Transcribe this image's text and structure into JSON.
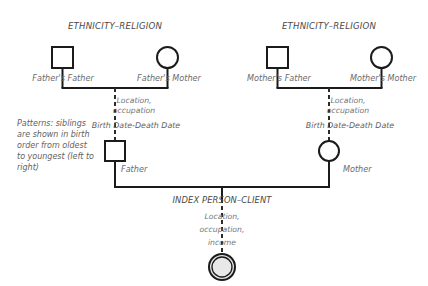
{
  "diagram": {
    "type": "genogram",
    "title_left": "ETHNICITY–RELIGION",
    "title_right": "ETHNICITY–RELIGION",
    "colors": {
      "line": "#1b1b1b",
      "text": "#6b6b6b",
      "heading_text": "#4a4a4a",
      "index_fill": "#e3e3e3",
      "background": "#ffffff"
    }
  },
  "paternal": {
    "heading": "ETHNICITY–RELIGION",
    "father_father_label": "Father's Father",
    "father_mother_label": "Father's Mother",
    "union_detail_line1": "Location,",
    "union_detail_line2": "occupation",
    "union_dates": "Birth Date-Death Date"
  },
  "maternal": {
    "heading": "ETHNICITY–RELIGION",
    "mother_father_label": "Mother's Father",
    "mother_mother_label": "Mother's Mother",
    "union_detail_line1": "Location,",
    "union_detail_line2": "occupation",
    "union_dates": "Birth Date-Death Date"
  },
  "parents": {
    "father_label": "Father",
    "mother_label": "Mother"
  },
  "index_person": {
    "label": "INDEX PERSON–CLIENT",
    "detail_line1": "Location,",
    "detail_line2": "occupation,",
    "detail_line3": "income"
  },
  "note": {
    "text": "Patterns: siblings are shown in birth order from oldest to youngest (left to right)"
  }
}
